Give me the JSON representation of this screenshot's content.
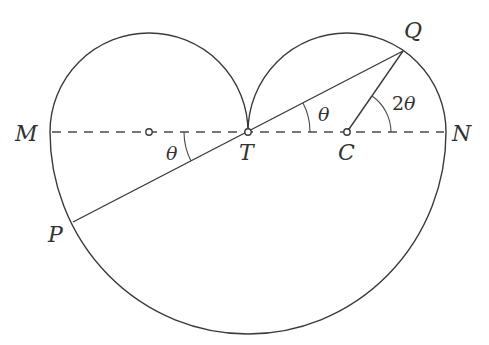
{
  "diagram": {
    "type": "geometry",
    "colors": {
      "stroke": "#3a3a3a",
      "background": "#ffffff"
    },
    "points": {
      "M": {
        "label": "M"
      },
      "N": {
        "label": "N"
      },
      "T": {
        "label": "T"
      },
      "C": {
        "label": "C"
      },
      "P": {
        "label": "P"
      },
      "Q": {
        "label": "Q"
      }
    },
    "angles": {
      "theta_at_T_upper": {
        "label": "θ"
      },
      "theta_at_T_lower": {
        "label": "θ"
      },
      "two_theta_at_C": {
        "label_num": "2",
        "label_sym": "θ"
      }
    }
  }
}
